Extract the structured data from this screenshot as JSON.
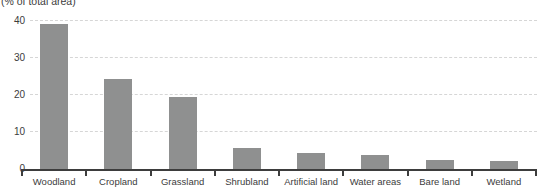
{
  "chart": {
    "unit_label": "(% of total area)",
    "colors": {
      "bar": "#8f9090",
      "axis": "#3d3d3d",
      "gridline": "#d6d6d6",
      "text": "#3c3c3c"
    }
  },
  "chart_data": {
    "type": "bar",
    "categories": [
      "Woodland",
      "Cropland",
      "Grassland",
      "Shrubland",
      "Artificial land",
      "Water areas",
      "Bare land",
      "Wetland"
    ],
    "values": [
      39.3,
      24.3,
      19.5,
      5.7,
      4.4,
      3.7,
      2.4,
      2.2
    ],
    "title": "",
    "xlabel": "",
    "ylabel": "(% of total area)",
    "ylim": [
      0,
      40
    ],
    "yticks": [
      0,
      10,
      20,
      30,
      40
    ],
    "grid": "horizontal-dashed",
    "legend": "none",
    "bar_color": "#8f9090"
  }
}
